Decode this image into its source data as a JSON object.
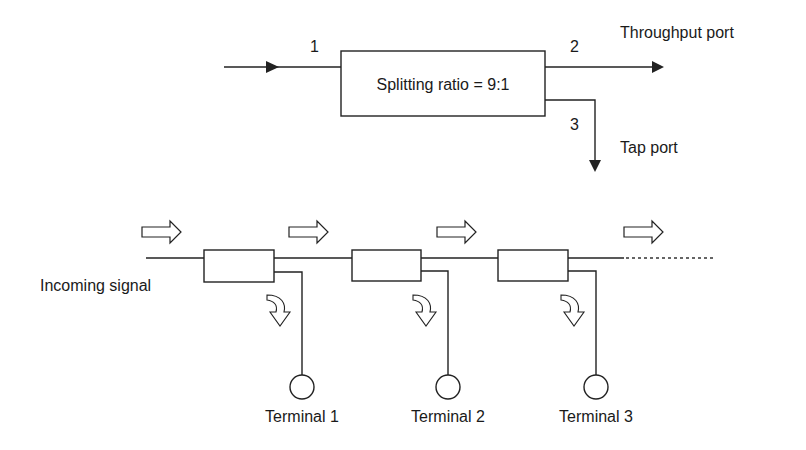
{
  "top_diagram": {
    "coupler_label": "Splitting ratio = 9:1",
    "port_numbers": {
      "input": "1",
      "throughput": "2",
      "tap": "3"
    },
    "throughput_label": "Throughput port",
    "tap_label": "Tap port"
  },
  "bottom_diagram": {
    "incoming_label": "Incoming signal",
    "terminals": [
      {
        "label": "Terminal 1"
      },
      {
        "label": "Terminal 2"
      },
      {
        "label": "Terminal 3"
      }
    ]
  },
  "colors": {
    "line": "#222222",
    "text": "#1a1a1a",
    "background": "#ffffff"
  }
}
